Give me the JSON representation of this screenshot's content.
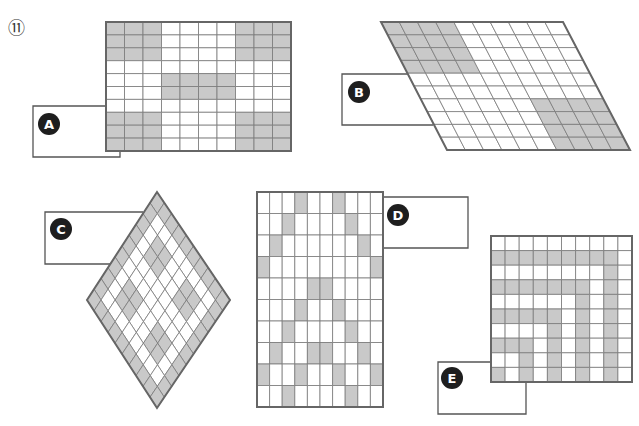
{
  "question_number": "⑪",
  "colors": {
    "fill_gray": "#c9c9c9",
    "fill_white": "#ffffff",
    "grid_line": "#7a7a7a",
    "border": "#666666",
    "label_box_line": "#555555",
    "badge_fill": "#1e1e1e",
    "badge_text": "#ffffff"
  },
  "figures": [
    {
      "id": "A",
      "label": "A",
      "shape": "rectangle",
      "cols": 10,
      "rows": 10,
      "corners": {
        "tl": [
          106,
          22
        ],
        "tr": [
          291,
          22
        ],
        "br": [
          291,
          151
        ],
        "bl": [
          106,
          151
        ]
      },
      "gray_cells": [
        [
          0,
          0
        ],
        [
          0,
          1
        ],
        [
          0,
          2
        ],
        [
          0,
          7
        ],
        [
          0,
          8
        ],
        [
          0,
          9
        ],
        [
          1,
          0
        ],
        [
          1,
          1
        ],
        [
          1,
          2
        ],
        [
          1,
          7
        ],
        [
          1,
          8
        ],
        [
          1,
          9
        ],
        [
          2,
          0
        ],
        [
          2,
          1
        ],
        [
          2,
          2
        ],
        [
          2,
          7
        ],
        [
          2,
          8
        ],
        [
          2,
          9
        ],
        [
          4,
          3
        ],
        [
          4,
          4
        ],
        [
          4,
          5
        ],
        [
          4,
          6
        ],
        [
          5,
          3
        ],
        [
          5,
          4
        ],
        [
          5,
          5
        ],
        [
          5,
          6
        ],
        [
          7,
          0
        ],
        [
          7,
          1
        ],
        [
          7,
          2
        ],
        [
          7,
          7
        ],
        [
          7,
          8
        ],
        [
          7,
          9
        ],
        [
          8,
          0
        ],
        [
          8,
          1
        ],
        [
          8,
          2
        ],
        [
          8,
          7
        ],
        [
          8,
          8
        ],
        [
          8,
          9
        ],
        [
          9,
          0
        ],
        [
          9,
          1
        ],
        [
          9,
          2
        ],
        [
          9,
          7
        ],
        [
          9,
          8
        ],
        [
          9,
          9
        ]
      ],
      "label_box": {
        "points": [
          [
            106,
            106
          ],
          [
            33,
            106
          ],
          [
            33,
            157
          ],
          [
            120,
            157
          ],
          [
            120,
            151
          ]
        ]
      },
      "badge": {
        "cx": 49,
        "cy": 124,
        "r": 11
      }
    },
    {
      "id": "B",
      "label": "B",
      "shape": "parallelogram",
      "cols": 10,
      "rows": 10,
      "corners": {
        "tl": [
          381,
          22
        ],
        "tr": [
          563,
          22
        ],
        "br": [
          630,
          150
        ],
        "bl": [
          447,
          150
        ]
      },
      "gray_cells": [
        [
          0,
          0
        ],
        [
          0,
          1
        ],
        [
          0,
          2
        ],
        [
          0,
          3
        ],
        [
          1,
          0
        ],
        [
          1,
          1
        ],
        [
          1,
          2
        ],
        [
          1,
          3
        ],
        [
          2,
          0
        ],
        [
          2,
          1
        ],
        [
          2,
          2
        ],
        [
          2,
          3
        ],
        [
          3,
          0
        ],
        [
          3,
          1
        ],
        [
          3,
          2
        ],
        [
          3,
          3
        ],
        [
          6,
          6
        ],
        [
          6,
          7
        ],
        [
          6,
          8
        ],
        [
          6,
          9
        ],
        [
          7,
          6
        ],
        [
          7,
          7
        ],
        [
          7,
          8
        ],
        [
          7,
          9
        ],
        [
          8,
          6
        ],
        [
          8,
          7
        ],
        [
          8,
          8
        ],
        [
          8,
          9
        ],
        [
          9,
          6
        ],
        [
          9,
          7
        ],
        [
          9,
          8
        ],
        [
          9,
          9
        ]
      ],
      "label_box": {
        "points": [
          [
            408,
            74
          ],
          [
            342,
            74
          ],
          [
            342,
            125
          ],
          [
            433,
            125
          ]
        ]
      },
      "badge": {
        "cx": 359,
        "cy": 92,
        "r": 11
      }
    },
    {
      "id": "C",
      "label": "C",
      "shape": "rhombus",
      "cols": 10,
      "rows": 10,
      "corners": {
        "tl": [
          157,
          192
        ],
        "tr": [
          230,
          300
        ],
        "br": [
          157,
          408
        ],
        "bl": [
          87,
          300
        ]
      },
      "gray_cells": [
        [
          0,
          0
        ],
        [
          0,
          1
        ],
        [
          0,
          2
        ],
        [
          0,
          3
        ],
        [
          0,
          4
        ],
        [
          0,
          5
        ],
        [
          0,
          6
        ],
        [
          0,
          7
        ],
        [
          0,
          8
        ],
        [
          0,
          9
        ],
        [
          9,
          0
        ],
        [
          9,
          1
        ],
        [
          9,
          2
        ],
        [
          9,
          3
        ],
        [
          9,
          4
        ],
        [
          9,
          5
        ],
        [
          9,
          6
        ],
        [
          9,
          7
        ],
        [
          9,
          8
        ],
        [
          9,
          9
        ],
        [
          1,
          0
        ],
        [
          2,
          0
        ],
        [
          3,
          0
        ],
        [
          4,
          0
        ],
        [
          5,
          0
        ],
        [
          6,
          0
        ],
        [
          7,
          0
        ],
        [
          8,
          0
        ],
        [
          1,
          9
        ],
        [
          2,
          9
        ],
        [
          3,
          9
        ],
        [
          4,
          9
        ],
        [
          5,
          9
        ],
        [
          6,
          9
        ],
        [
          7,
          9
        ],
        [
          8,
          9
        ],
        [
          2,
          2
        ],
        [
          2,
          3
        ],
        [
          3,
          2
        ],
        [
          3,
          3
        ],
        [
          2,
          6
        ],
        [
          2,
          7
        ],
        [
          3,
          6
        ],
        [
          3,
          7
        ],
        [
          6,
          2
        ],
        [
          6,
          3
        ],
        [
          7,
          2
        ],
        [
          7,
          3
        ],
        [
          6,
          6
        ],
        [
          6,
          7
        ],
        [
          7,
          6
        ],
        [
          7,
          7
        ]
      ],
      "label_box": {
        "points": [
          [
            143,
            212
          ],
          [
            45,
            212
          ],
          [
            45,
            264
          ],
          [
            110,
            264
          ]
        ]
      },
      "badge": {
        "cx": 61,
        "cy": 229,
        "r": 11
      }
    },
    {
      "id": "D",
      "label": "D",
      "shape": "rectangle",
      "cols": 10,
      "rows": 10,
      "corners": {
        "tl": [
          257,
          192
        ],
        "tr": [
          383,
          192
        ],
        "br": [
          383,
          407
        ],
        "bl": [
          257,
          407
        ]
      },
      "gray_cells": [
        [
          0,
          3
        ],
        [
          0,
          6
        ],
        [
          1,
          2
        ],
        [
          1,
          7
        ],
        [
          2,
          1
        ],
        [
          2,
          8
        ],
        [
          3,
          0
        ],
        [
          3,
          9
        ],
        [
          4,
          4
        ],
        [
          4,
          5
        ],
        [
          5,
          3
        ],
        [
          5,
          6
        ],
        [
          6,
          2
        ],
        [
          6,
          7
        ],
        [
          7,
          1
        ],
        [
          7,
          4
        ],
        [
          7,
          5
        ],
        [
          7,
          8
        ],
        [
          8,
          0
        ],
        [
          8,
          3
        ],
        [
          8,
          6
        ],
        [
          8,
          9
        ],
        [
          9,
          2
        ],
        [
          9,
          7
        ]
      ],
      "label_box": {
        "points": [
          [
            383,
            197
          ],
          [
            468,
            197
          ],
          [
            468,
            248
          ],
          [
            383,
            248
          ]
        ]
      },
      "badge": {
        "cx": 398,
        "cy": 215,
        "r": 11
      }
    },
    {
      "id": "E",
      "label": "E",
      "shape": "rectangle",
      "cols": 10,
      "rows": 10,
      "corners": {
        "tl": [
          491,
          236
        ],
        "tr": [
          632,
          236
        ],
        "br": [
          632,
          382
        ],
        "bl": [
          491,
          382
        ]
      },
      "gray_cells": [
        [
          1,
          0
        ],
        [
          1,
          1
        ],
        [
          1,
          2
        ],
        [
          1,
          3
        ],
        [
          1,
          4
        ],
        [
          1,
          5
        ],
        [
          1,
          6
        ],
        [
          1,
          7
        ],
        [
          1,
          8
        ],
        [
          2,
          8
        ],
        [
          3,
          0
        ],
        [
          3,
          1
        ],
        [
          3,
          2
        ],
        [
          3,
          3
        ],
        [
          3,
          4
        ],
        [
          3,
          5
        ],
        [
          3,
          6
        ],
        [
          3,
          8
        ],
        [
          4,
          6
        ],
        [
          4,
          8
        ],
        [
          5,
          0
        ],
        [
          5,
          1
        ],
        [
          5,
          2
        ],
        [
          5,
          3
        ],
        [
          5,
          4
        ],
        [
          5,
          6
        ],
        [
          5,
          8
        ],
        [
          6,
          4
        ],
        [
          6,
          6
        ],
        [
          6,
          8
        ],
        [
          7,
          0
        ],
        [
          7,
          1
        ],
        [
          7,
          2
        ],
        [
          7,
          4
        ],
        [
          7,
          6
        ],
        [
          7,
          8
        ],
        [
          8,
          2
        ],
        [
          8,
          4
        ],
        [
          8,
          6
        ],
        [
          8,
          8
        ],
        [
          9,
          0
        ],
        [
          9,
          2
        ],
        [
          9,
          4
        ],
        [
          9,
          6
        ],
        [
          9,
          8
        ]
      ],
      "label_box": {
        "points": [
          [
            491,
            362
          ],
          [
            438,
            362
          ],
          [
            438,
            414
          ],
          [
            526,
            414
          ],
          [
            526,
            382
          ]
        ]
      },
      "badge": {
        "cx": 452,
        "cy": 378,
        "r": 11
      }
    }
  ]
}
